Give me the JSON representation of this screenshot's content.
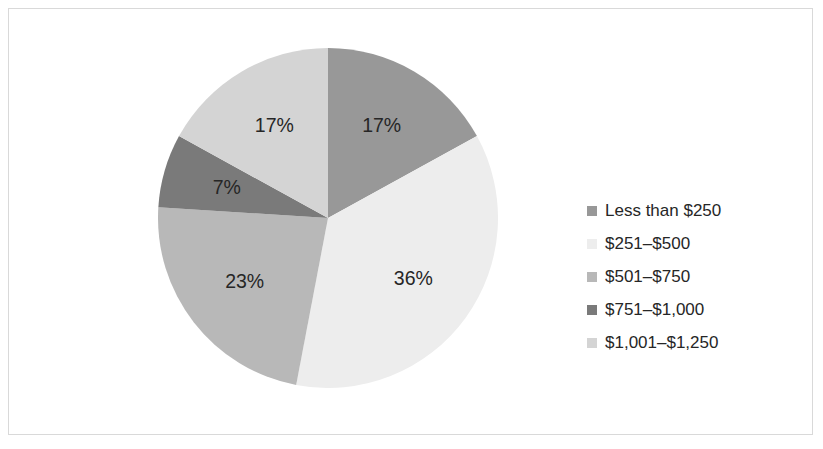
{
  "chart_data": {
    "type": "pie",
    "title": "",
    "subtitle": "",
    "xlabel": "",
    "ylabel": "",
    "grid": false,
    "legend_position": "right",
    "start_angle_deg": 0,
    "direction": "clockwise",
    "categories": [
      "Less than $250",
      "$251–$500",
      "$501–$750",
      "$751–$1,000",
      "$1,001–$1,250"
    ],
    "values": [
      17,
      36,
      23,
      7,
      17
    ],
    "value_unit": "percent",
    "data_labels": [
      "17%",
      "36%",
      "23%",
      "7%",
      "17%"
    ],
    "colors": [
      "#989898",
      "#ededed",
      "#b8b8b8",
      "#7a7a7a",
      "#d4d4d4"
    ],
    "slices": [
      {
        "label": "Less than $250",
        "value": 17,
        "data_label": "17%",
        "color": "#989898",
        "label_x": 408,
        "label_y": 105
      },
      {
        "label": "$251–$500",
        "value": 36,
        "data_label": "36%",
        "color": "#ededed",
        "label_x": 424,
        "label_y": 311
      },
      {
        "label": "$501–$750",
        "value": 23,
        "data_label": "23%",
        "color": "#b8b8b8",
        "label_x": 241,
        "label_y": 315
      },
      {
        "label": "$751–$1,000",
        "value": 7,
        "data_label": "7%",
        "color": "#7a7a7a",
        "label_x": 203,
        "label_y": 187
      },
      {
        "label": "$1,001–$1,250",
        "value": 17,
        "data_label": "17%",
        "color": "#d4d4d4",
        "label_x": 268,
        "label_y": 104
      }
    ]
  },
  "legend": {
    "items": [
      {
        "label": "Less than $250",
        "color": "#989898"
      },
      {
        "label": "$251–$500",
        "color": "#ededed"
      },
      {
        "label": "$501–$750",
        "color": "#b8b8b8"
      },
      {
        "label": "$751–$1,000",
        "color": "#7a7a7a"
      },
      {
        "label": "$1,001–$1,250",
        "color": "#d4d4d4"
      }
    ]
  },
  "style": {
    "background": "#ffffff",
    "border_color": "#d9d9d9",
    "text_color": "#262626"
  }
}
